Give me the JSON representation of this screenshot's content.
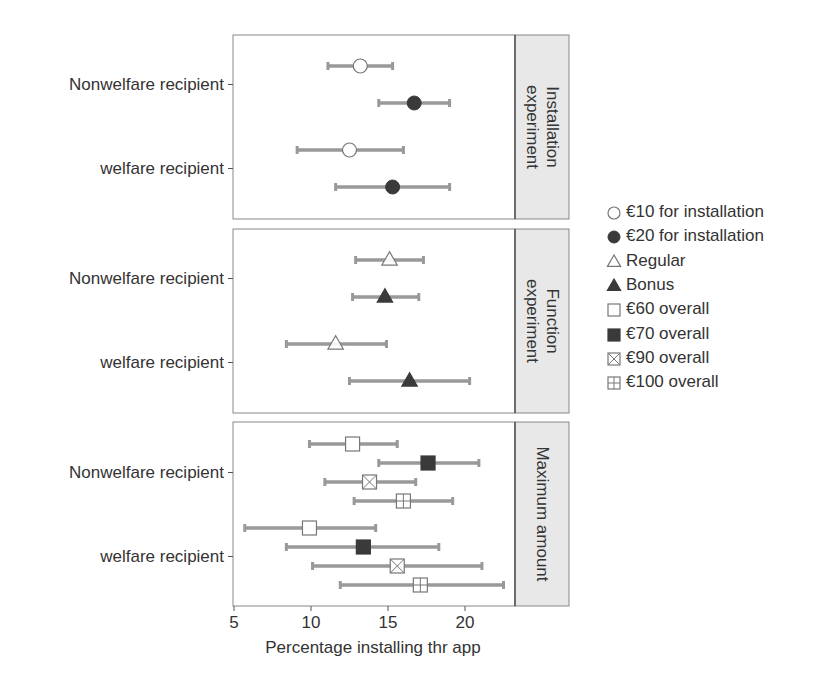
{
  "chart_data": {
    "type": "scatter",
    "subtype": "dot-and-whisker (point estimate with confidence interval), faceted",
    "xlabel": "Percentage installing thr app",
    "xlim": [
      5,
      23.4
    ],
    "xticks": [
      5,
      10,
      15,
      20
    ],
    "ylabels": [
      "Nonwelfare recipient",
      "welfare recipient"
    ],
    "grid": false,
    "legend_position": "right",
    "legend": [
      {
        "label": "€10 for installation",
        "marker": "circle-open"
      },
      {
        "label": "€20 for installation",
        "marker": "circle-filled"
      },
      {
        "label": "Regular",
        "marker": "triangle-open"
      },
      {
        "label": "Bonus",
        "marker": "triangle-filled"
      },
      {
        "label": "€60 overall",
        "marker": "square-open"
      },
      {
        "label": "€70 overall",
        "marker": "square-filled"
      },
      {
        "label": "€90 overall",
        "marker": "square-cross"
      },
      {
        "label": "€100 overall",
        "marker": "square-plus"
      }
    ],
    "panels": [
      {
        "strip": [
          "Installation",
          "experiment"
        ],
        "points": [
          {
            "group": "Nonwelfare recipient",
            "series": "€10 for installation",
            "marker": "circle-open",
            "value": 13.2,
            "lo": 11.1,
            "hi": 15.3
          },
          {
            "group": "Nonwelfare recipient",
            "series": "€20 for installation",
            "marker": "circle-filled",
            "value": 16.7,
            "lo": 14.4,
            "hi": 19.0
          },
          {
            "group": "welfare recipient",
            "series": "€10 for installation",
            "marker": "circle-open",
            "value": 12.5,
            "lo": 9.1,
            "hi": 16.0
          },
          {
            "group": "welfare recipient",
            "series": "€20 for installation",
            "marker": "circle-filled",
            "value": 15.3,
            "lo": 11.6,
            "hi": 19.0
          }
        ]
      },
      {
        "strip": [
          "Function",
          "experiment"
        ],
        "points": [
          {
            "group": "Nonwelfare recipient",
            "series": "Regular",
            "marker": "triangle-open",
            "value": 15.1,
            "lo": 12.9,
            "hi": 17.3
          },
          {
            "group": "Nonwelfare recipient",
            "series": "Bonus",
            "marker": "triangle-filled",
            "value": 14.8,
            "lo": 12.7,
            "hi": 17.0
          },
          {
            "group": "welfare recipient",
            "series": "Regular",
            "marker": "triangle-open",
            "value": 11.6,
            "lo": 8.4,
            "hi": 14.9
          },
          {
            "group": "welfare recipient",
            "series": "Bonus",
            "marker": "triangle-filled",
            "value": 16.4,
            "lo": 12.5,
            "hi": 20.3
          }
        ]
      },
      {
        "strip": [
          "Maximum amount"
        ],
        "points": [
          {
            "group": "Nonwelfare recipient",
            "series": "€60 overall",
            "marker": "square-open",
            "value": 12.7,
            "lo": 9.9,
            "hi": 15.6
          },
          {
            "group": "Nonwelfare recipient",
            "series": "€70 overall",
            "marker": "square-filled",
            "value": 17.6,
            "lo": 14.4,
            "hi": 20.9
          },
          {
            "group": "Nonwelfare recipient",
            "series": "€90 overall",
            "marker": "square-cross",
            "value": 13.8,
            "lo": 10.9,
            "hi": 16.8
          },
          {
            "group": "Nonwelfare recipient",
            "series": "€100 overall",
            "marker": "square-plus",
            "value": 16.0,
            "lo": 12.8,
            "hi": 19.2
          },
          {
            "group": "welfare recipient",
            "series": "€60 overall",
            "marker": "square-open",
            "value": 9.9,
            "lo": 5.7,
            "hi": 14.2
          },
          {
            "group": "welfare recipient",
            "series": "€70 overall",
            "marker": "square-filled",
            "value": 13.4,
            "lo": 8.4,
            "hi": 18.3
          },
          {
            "group": "welfare recipient",
            "series": "€90 overall",
            "marker": "square-cross",
            "value": 15.6,
            "lo": 10.1,
            "hi": 21.1
          },
          {
            "group": "welfare recipient",
            "series": "€100 overall",
            "marker": "square-plus",
            "value": 17.1,
            "lo": 11.9,
            "hi": 22.5
          }
        ]
      }
    ]
  },
  "colors": {
    "errorbar": "#999999",
    "marker_fill": "#3a3a3a",
    "marker_open_stroke": "#777777",
    "panel_border": "#888888",
    "strip_bg": "#e8e8e8",
    "text": "#333333"
  }
}
